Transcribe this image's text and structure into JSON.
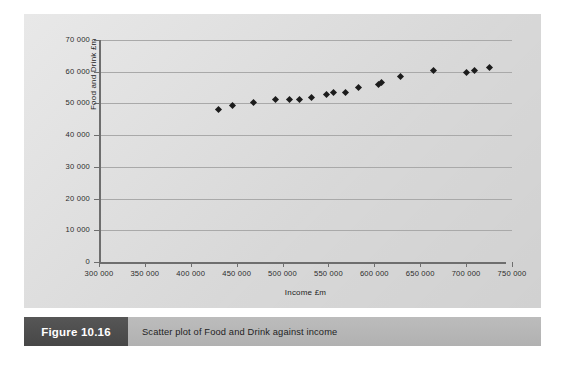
{
  "figure": {
    "number_label": "Figure 10.16",
    "caption": "Scatter plot of Food and Drink against income"
  },
  "colors": {
    "panel_background": "#dcdcdc",
    "page_background": "#ffffff",
    "gridline": "#a9a9a9",
    "axis_line": "#6e6e6e",
    "marker": "#1c1c1c",
    "caption_bar": "#b6b6b6",
    "figure_number_box": "#4f4f4f",
    "figure_number_text": "#ffffff"
  },
  "chart_data": {
    "type": "scatter",
    "title": "",
    "xlabel": "Income £m",
    "ylabel": "Food and Drink £m",
    "xlim": [
      300000,
      750000
    ],
    "ylim": [
      0,
      70000
    ],
    "xticks": [
      300000,
      350000,
      400000,
      450000,
      500000,
      550000,
      600000,
      650000,
      700000,
      750000
    ],
    "xtick_labels": [
      "300 000",
      "350 000",
      "400 000",
      "450 000",
      "500 000",
      "550 000",
      "600 000",
      "650 000",
      "700 000",
      "750 000"
    ],
    "yticks": [
      0,
      10000,
      20000,
      30000,
      40000,
      50000,
      60000,
      70000
    ],
    "ytick_labels": [
      "0",
      "10 000",
      "20 000",
      "30 000",
      "40 000",
      "50 000",
      "60 000",
      "70 000"
    ],
    "grid": "horizontal",
    "legend": "none",
    "marker_shape": "diamond",
    "series": [
      {
        "name": "Food and Drink vs Income",
        "points": [
          [
            430000,
            48200
          ],
          [
            446000,
            49300
          ],
          [
            468000,
            50300
          ],
          [
            492000,
            51300
          ],
          [
            508000,
            51100
          ],
          [
            518000,
            51200
          ],
          [
            532000,
            51900
          ],
          [
            548000,
            52800
          ],
          [
            556000,
            53300
          ],
          [
            569000,
            53400
          ],
          [
            583000,
            55100
          ],
          [
            605000,
            56000
          ],
          [
            608000,
            56700
          ],
          [
            628000,
            58600
          ],
          [
            665000,
            60400
          ],
          [
            700000,
            59800
          ],
          [
            709000,
            60500
          ],
          [
            726000,
            61400
          ]
        ]
      }
    ]
  }
}
